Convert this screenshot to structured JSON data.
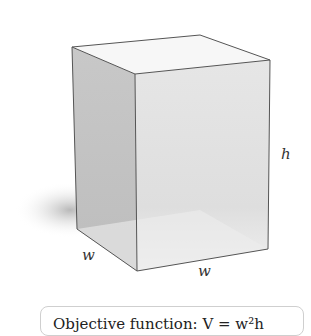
{
  "diagram": {
    "type": "rectangular-box",
    "labels": {
      "height": "h",
      "width_left": "w",
      "width_front": "w"
    }
  },
  "caption": {
    "text": "Objective function: V = w²h"
  }
}
